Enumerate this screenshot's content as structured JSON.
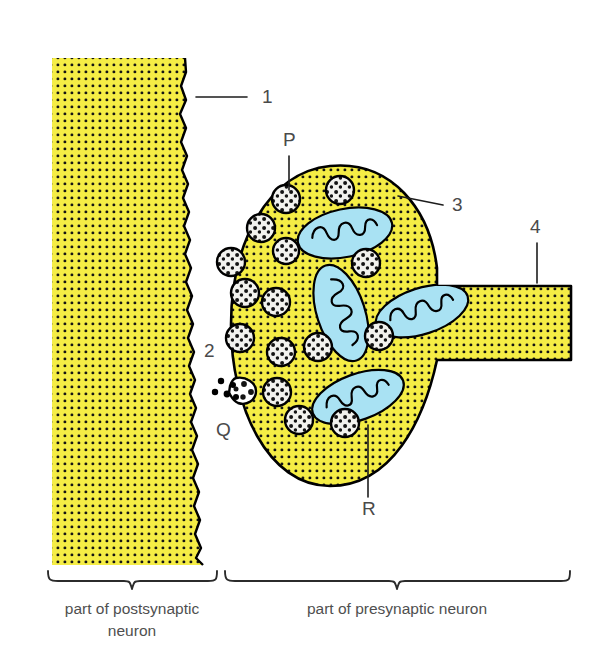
{
  "figure": {
    "background": "#ffffff"
  },
  "colors": {
    "cytoplasm": "#F5ED45",
    "cytoplasm_stipple": "#141414",
    "membrane_outline": "#000000",
    "vesicle_fill": "#F2F2EE",
    "vesicle_granule": "#141414",
    "mitochondrion_fill": "#A9E2F3",
    "mitochondrion_outline": "#000000",
    "label_text": "#4a4a4a",
    "caption_text": "#4f4f4f",
    "leader_line": "#1d1d1d"
  },
  "captions": {
    "postsynaptic_line1": "part of postsynaptic",
    "postsynaptic_line2": "neuron",
    "presynaptic": "part of presynaptic neuron"
  },
  "labels": [
    {
      "id": "label-1",
      "text": "1",
      "x": 262,
      "y": 103,
      "kind": "number",
      "leader": {
        "x1": 247,
        "y1": 97,
        "x2": 196,
        "y2": 97
      },
      "refers_to": "postsynaptic membrane"
    },
    {
      "id": "label-2",
      "text": "2",
      "x": 204,
      "y": 357,
      "kind": "number",
      "leader": null,
      "refers_to": "synaptic cleft"
    },
    {
      "id": "label-3",
      "text": "3",
      "x": 452,
      "y": 211,
      "kind": "number",
      "leader": {
        "x1": 443,
        "y1": 205,
        "x2": 398,
        "y2": 196
      },
      "refers_to": "presynaptic membrane"
    },
    {
      "id": "label-4",
      "text": "4",
      "x": 530,
      "y": 233,
      "kind": "number",
      "leader": {
        "x1": 537,
        "y1": 243,
        "x2": 537,
        "y2": 283
      },
      "refers_to": "axon"
    },
    {
      "id": "label-P",
      "text": "P",
      "x": 283,
      "y": 146,
      "kind": "letter",
      "leader": {
        "x1": 289,
        "y1": 156,
        "x2": 289,
        "y2": 190
      },
      "refers_to": "synaptic vesicle"
    },
    {
      "id": "label-Q",
      "text": "Q",
      "x": 216,
      "y": 436,
      "kind": "letter",
      "leader": null,
      "refers_to": "neurotransmitter release site"
    },
    {
      "id": "label-R",
      "text": "R",
      "x": 362,
      "y": 515,
      "kind": "letter",
      "leader": {
        "x1": 368,
        "y1": 497,
        "x2": 368,
        "y2": 425
      },
      "refers_to": "mitochondrion"
    }
  ],
  "postsynaptic_neuron": {
    "name": "part of postsynaptic neuron",
    "bounds": {
      "left": 52,
      "top": 58,
      "right": 215,
      "bottom": 565
    }
  },
  "presynaptic_neuron": {
    "name": "part of presynaptic neuron",
    "bouton": {
      "cx": 330,
      "cy": 325,
      "rx": 100,
      "ry": 160
    },
    "axon": {
      "x": 430,
      "y_top": 286,
      "y_bottom": 360,
      "x_end": 571
    }
  },
  "synaptic_cleft": {
    "name": "synaptic cleft",
    "width_px": 14
  },
  "vesicles": [
    {
      "cx": 286,
      "cy": 199,
      "r": 14
    },
    {
      "cx": 340,
      "cy": 190,
      "r": 14
    },
    {
      "cx": 261,
      "cy": 228,
      "r": 14
    },
    {
      "cx": 231,
      "cy": 262,
      "r": 14
    },
    {
      "cx": 286,
      "cy": 251,
      "r": 13
    },
    {
      "cx": 245,
      "cy": 293,
      "r": 14
    },
    {
      "cx": 366,
      "cy": 263,
      "r": 14
    },
    {
      "cx": 276,
      "cy": 302,
      "r": 14
    },
    {
      "cx": 240,
      "cy": 338,
      "r": 14
    },
    {
      "cx": 281,
      "cy": 352,
      "r": 14
    },
    {
      "cx": 318,
      "cy": 347,
      "r": 14
    },
    {
      "cx": 379,
      "cy": 336,
      "r": 14
    },
    {
      "cx": 277,
      "cy": 392,
      "r": 14
    },
    {
      "cx": 299,
      "cy": 420,
      "r": 14
    },
    {
      "cx": 345,
      "cy": 423,
      "r": 14
    }
  ],
  "fusing_vesicle": {
    "name": "vesicle fusing with presynaptic membrane",
    "cx": 242,
    "cy": 390,
    "r": 13
  },
  "neurotransmitter_dots": [
    {
      "cx": 221,
      "cy": 381,
      "r": 3.2
    },
    {
      "cx": 215,
      "cy": 392,
      "r": 3.2
    },
    {
      "cx": 227,
      "cy": 394,
      "r": 3.4
    },
    {
      "cx": 233,
      "cy": 385,
      "r": 3.0
    },
    {
      "cx": 236,
      "cy": 397,
      "r": 3.0
    }
  ],
  "mitochondria": [
    {
      "id": "mito-top",
      "cx": 345,
      "cy": 233,
      "rx": 48,
      "ry": 24,
      "rotation": -12
    },
    {
      "id": "mito-middle",
      "cx": 341,
      "cy": 313,
      "rx": 50,
      "ry": 24,
      "rotation": 72
    },
    {
      "id": "mito-right",
      "cx": 422,
      "cy": 311,
      "rx": 48,
      "ry": 23,
      "rotation": -18
    },
    {
      "id": "mito-bottom",
      "cx": 358,
      "cy": 397,
      "rx": 48,
      "ry": 23,
      "rotation": -20
    }
  ],
  "braces": [
    {
      "id": "brace-postsynaptic",
      "x1": 47,
      "x2": 218,
      "y": 578
    },
    {
      "id": "brace-presynaptic",
      "x1": 224,
      "x2": 571,
      "y": 578
    }
  ]
}
